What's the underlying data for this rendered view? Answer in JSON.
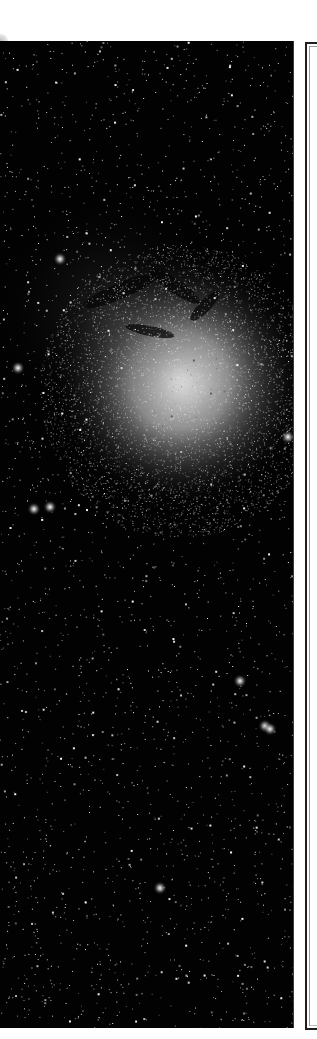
{
  "image": {
    "subject": "starfield with bright diffuse nebula",
    "description": "Deep-sky astrophotograph: dense field of stars on black background with a large glowing white nebula and dark dust lanes in the upper-middle region, plus a few brighter stars scattered below.",
    "colors": {
      "sky": "#020202",
      "nebula_core": "#e8e8e8",
      "stars": "#ffffff",
      "page_background": "#ffffff",
      "frame_border": "#1e1e1e"
    }
  },
  "side_panel": {
    "label": ""
  }
}
